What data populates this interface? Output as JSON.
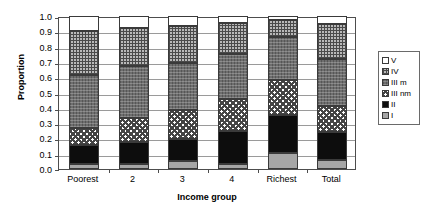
{
  "chart_data": {
    "type": "bar",
    "subtype": "stacked-100",
    "title": "",
    "xlabel": "Income group",
    "ylabel": "Proportion",
    "categories": [
      "Poorest",
      "2",
      "3",
      "4",
      "Richest",
      "Total"
    ],
    "ylim": [
      0.0,
      1.0
    ],
    "yticks": [
      "0.0",
      "0.1",
      "0.2",
      "0.3",
      "0.4",
      "0.5",
      "0.6",
      "0.7",
      "0.8",
      "0.9",
      "1.0"
    ],
    "ytick_values": [
      0.0,
      0.1,
      0.2,
      0.3,
      0.4,
      0.5,
      0.6,
      0.7,
      0.8,
      0.9,
      1.0
    ],
    "grid": true,
    "grid_axis": "y",
    "legend_position": "right",
    "legend_entries": [
      "V",
      "IV",
      "III m",
      "III nm",
      "II",
      "I"
    ],
    "stack_order_bottom_to_top": [
      "I",
      "II",
      "III nm",
      "III m",
      "IV",
      "V"
    ],
    "series": [
      {
        "name": "I",
        "values": [
          0.03,
          0.035,
          0.05,
          0.035,
          0.105,
          0.06
        ]
      },
      {
        "name": "II",
        "values": [
          0.13,
          0.14,
          0.145,
          0.215,
          0.245,
          0.185
        ]
      },
      {
        "name": "III nm",
        "values": [
          0.11,
          0.16,
          0.19,
          0.21,
          0.235,
          0.165
        ]
      },
      {
        "name": "III m",
        "values": [
          0.345,
          0.34,
          0.305,
          0.29,
          0.28,
          0.31
        ]
      },
      {
        "name": "IV",
        "values": [
          0.29,
          0.245,
          0.245,
          0.205,
          0.11,
          0.225
        ]
      },
      {
        "name": "V",
        "values": [
          0.095,
          0.08,
          0.065,
          0.045,
          0.025,
          0.055
        ]
      }
    ],
    "cumulative_tops": [
      {
        "category": "Poorest",
        "I": 0.03,
        "II": 0.16,
        "III nm": 0.27,
        "III m": 0.615,
        "IV": 0.905,
        "V": 1.0
      },
      {
        "category": "2",
        "I": 0.035,
        "II": 0.175,
        "III nm": 0.335,
        "III m": 0.675,
        "IV": 0.92,
        "V": 1.0
      },
      {
        "category": "3",
        "I": 0.05,
        "II": 0.195,
        "III nm": 0.385,
        "III m": 0.69,
        "IV": 0.935,
        "V": 1.0
      },
      {
        "category": "4",
        "I": 0.035,
        "II": 0.25,
        "III nm": 0.46,
        "III m": 0.75,
        "IV": 0.955,
        "V": 1.0
      },
      {
        "category": "Richest",
        "I": 0.105,
        "II": 0.35,
        "III nm": 0.585,
        "III m": 0.865,
        "IV": 0.975,
        "V": 1.0
      },
      {
        "category": "Total",
        "I": 0.06,
        "II": 0.245,
        "III nm": 0.41,
        "III m": 0.72,
        "IV": 0.945,
        "V": 1.0
      }
    ],
    "colors": {
      "I": "#a6a6a6",
      "II": "#0d0d0d",
      "III nm": "#ffffff",
      "III m": "#6e6e6e",
      "IV": "#b9b9b9",
      "V": "#ffffff",
      "axis": "#4d4d4d",
      "grid": "#9a9a9a"
    }
  }
}
